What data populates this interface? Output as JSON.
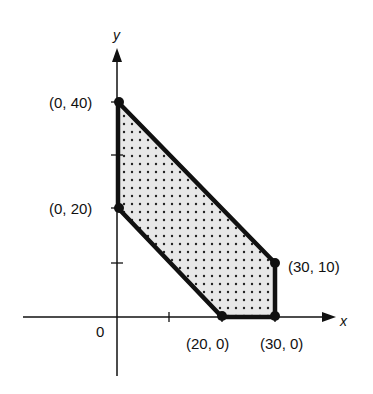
{
  "diagram": {
    "type": "feasible-region",
    "axes": {
      "x_label": "x",
      "y_label": "y",
      "origin_label": "0"
    },
    "vertices": [
      {
        "label": "(0, 40)",
        "x": 0,
        "y": 40
      },
      {
        "label": "(30, 10)",
        "x": 30,
        "y": 10
      },
      {
        "label": "(30, 0)",
        "x": 30,
        "y": 0
      },
      {
        "label": "(20, 0)",
        "x": 20,
        "y": 0
      },
      {
        "label": "(0, 20)",
        "x": 0,
        "y": 20
      }
    ],
    "ticks": {
      "x": [
        10,
        20,
        30
      ],
      "y": [
        10,
        20,
        30,
        40
      ]
    },
    "colors": {
      "line": "#111111",
      "fill": "#e6e6e6",
      "dot": "#222222"
    }
  }
}
